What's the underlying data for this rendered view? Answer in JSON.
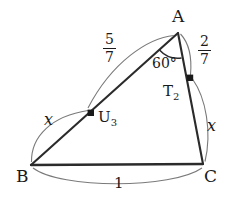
{
  "figure": {
    "type": "geometry-diagram",
    "stroke_color": "#2b2b2b",
    "arc_color": "#6b6b6b",
    "text_color": "#1a1a1a",
    "background": "#ffffff",
    "vertices": [
      {
        "name": "A",
        "label": "A",
        "x": 178,
        "y": 33
      },
      {
        "name": "B",
        "label": "B",
        "x": 31,
        "y": 165
      },
      {
        "name": "C",
        "label": "C",
        "x": 203,
        "y": 164
      }
    ],
    "marked_points": [
      {
        "name": "U3",
        "label": "U",
        "sub": "3",
        "x": 91,
        "y": 113
      },
      {
        "name": "T2",
        "label": "T",
        "sub": "2",
        "x": 190,
        "y": 78
      }
    ],
    "segments": [
      {
        "name": "AB",
        "from": "A",
        "to": "B"
      },
      {
        "name": "AC",
        "from": "A",
        "to": "C"
      },
      {
        "name": "BC",
        "from": "B",
        "to": "C"
      }
    ],
    "angle": {
      "at": "A",
      "label": "60°",
      "value": 60,
      "unit": "degrees"
    },
    "measure_labels": [
      {
        "name": "segment-AU3-measure",
        "text": "5/7",
        "numerator": "5",
        "denominator": "7",
        "spans": "A to U3"
      },
      {
        "name": "segment-AT2-measure",
        "text": "2/7",
        "numerator": "2",
        "denominator": "7",
        "spans": "A to T2"
      },
      {
        "name": "segment-BU3-measure",
        "text": "x",
        "spans": "B to U3"
      },
      {
        "name": "segment-T2C-measure",
        "text": "x",
        "spans": "T2 to C"
      },
      {
        "name": "segment-BC-measure",
        "text": "1",
        "spans": "B to C"
      }
    ]
  }
}
